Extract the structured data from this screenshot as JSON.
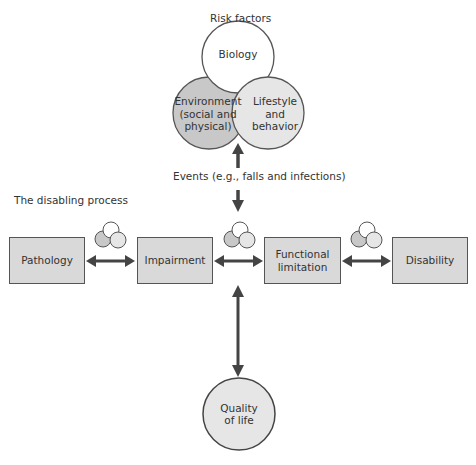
{
  "risk_factors": {
    "title": "Risk factors",
    "biology": "Biology",
    "environment": "Environment (social and physical)",
    "lifestyle": "Lifestyle and behavior"
  },
  "events_label": "Events (e.g., falls and infections)",
  "process_title": "The disabling process",
  "stages": [
    {
      "label": "Pathology"
    },
    {
      "label": "Impairment"
    },
    {
      "label": "Functional limitation"
    },
    {
      "label": "Disability"
    }
  ],
  "outcome": {
    "label": "Quality of life"
  },
  "colors": {
    "box_fill": "#d9d9d9",
    "environment_fill": "#c8c8c8",
    "lifestyle_fill": "#e6e6e6",
    "biology_fill": "#ffffff",
    "arrow": "#444444",
    "outline": "#555555"
  }
}
